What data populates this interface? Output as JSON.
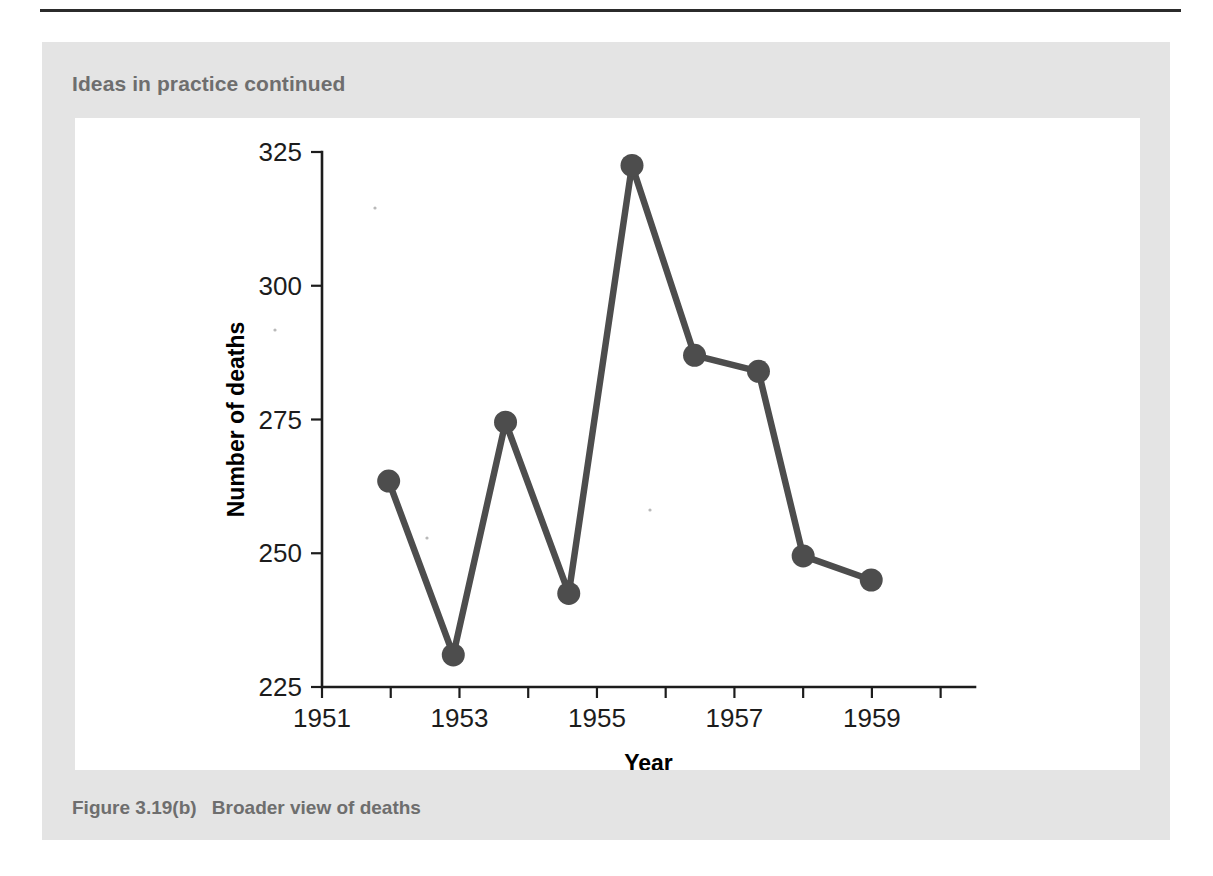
{
  "panel": {
    "header": "Ideas in practice continued",
    "caption_number": "Figure 3.19(b)",
    "caption_text": "Broader view of deaths",
    "panel_color": "#e4e4e4",
    "header_color": "#6e6e6e",
    "canvas_color": "#ffffff",
    "rule_color": "#2b2b2b"
  },
  "chart_data": {
    "type": "line",
    "title": "",
    "subtitle": "",
    "xlabel": "Year",
    "ylabel": "Number of deaths",
    "xlim": [
      1951,
      1960.5
    ],
    "ylim": [
      225,
      325
    ],
    "grid": false,
    "legend": null,
    "legend_position": "none",
    "series_color": "#4d4d4d",
    "marker": "circle",
    "x_tick_values": [
      1951,
      1952,
      1953,
      1954,
      1955,
      1956,
      1957,
      1958,
      1959,
      1960
    ],
    "x_tick_labels": [
      "1951",
      "",
      "1953",
      "",
      "1955",
      "",
      "1957",
      "",
      "1959",
      ""
    ],
    "x_labeled_ticks": [
      "1951",
      "1953",
      "1955",
      "1957",
      "1959"
    ],
    "y_tick_values": [
      225,
      250,
      275,
      300,
      325
    ],
    "y_tick_labels": [
      "225",
      "250",
      "275",
      "300",
      "325"
    ],
    "series": [
      {
        "name": "Number of deaths",
        "x": [
          1951.97,
          1952.91,
          1953.67,
          1954.59,
          1955.51,
          1956.42,
          1957.35,
          1958.0,
          1958.99
        ],
        "values": [
          263.5,
          231.0,
          274.5,
          242.5,
          322.5,
          287.0,
          284.0,
          249.5,
          245.0
        ]
      }
    ],
    "points": [
      {
        "x": 1951.97,
        "y": 263.5
      },
      {
        "x": 1952.91,
        "y": 231.0
      },
      {
        "x": 1953.67,
        "y": 274.5
      },
      {
        "x": 1954.59,
        "y": 242.5
      },
      {
        "x": 1955.51,
        "y": 322.5
      },
      {
        "x": 1956.42,
        "y": 287.0
      },
      {
        "x": 1957.35,
        "y": 284.0
      },
      {
        "x": 1958.0,
        "y": 249.5
      },
      {
        "x": 1958.99,
        "y": 245.0
      }
    ]
  }
}
